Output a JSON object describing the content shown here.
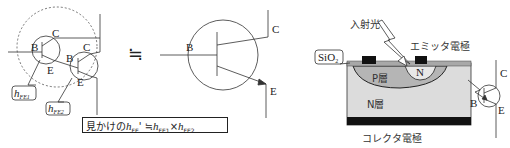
{
  "darlington": {
    "q1": {
      "base": "B",
      "collector": "C",
      "emitter": "E"
    },
    "q2": {
      "base": "B",
      "collector": "C",
      "emitter": "E"
    },
    "hfe1_label": "h",
    "hfe1_sub": "FE1",
    "hfe2_label": "h",
    "hfe2_sub": "FE2"
  },
  "approx_symbol": "≒",
  "equivalent": {
    "base": "B",
    "collector": "C",
    "emitter": "E"
  },
  "formula": {
    "prefix": "見かけの",
    "h": "h",
    "sub_fe": "FE",
    "prime": "'",
    "approx": "≒",
    "h1": "h",
    "sub1": "FE1",
    "times": "×",
    "h2": "h",
    "sub2": "FE2"
  },
  "phototransistor": {
    "incident_light": "入射光",
    "sio2": "SiO",
    "sio2_sub": "2",
    "emitter_electrode": "エミッタ電極",
    "p_layer": "P層",
    "n_region": "N",
    "n_layer": "N層",
    "collector_electrode": "コレクタ電極"
  },
  "photo_symbol": {
    "base": "B",
    "collector": "C",
    "emitter": "E"
  }
}
